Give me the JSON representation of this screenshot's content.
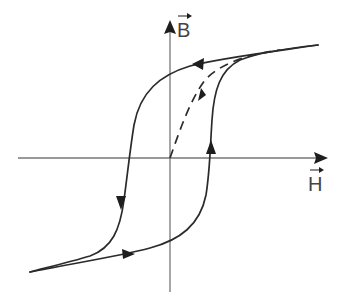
{
  "diagram": {
    "axes": {
      "y_label": "B",
      "x_label": "H",
      "y_label_vector": true,
      "x_label_vector": true
    },
    "curves": [
      {
        "name": "upper-branch",
        "style": "solid",
        "direction": "decreasing H",
        "from": "positive saturation",
        "to": "negative saturation"
      },
      {
        "name": "lower-branch",
        "style": "solid",
        "direction": "increasing H",
        "from": "negative saturation",
        "to": "positive saturation"
      },
      {
        "name": "initial-magnetization-curve",
        "style": "dashed",
        "direction": "increasing H",
        "from": "origin",
        "to": "positive saturation"
      }
    ],
    "colors": {
      "axis": "#777777",
      "curve": "#2b2b2b",
      "label": "#444444",
      "background": "#ffffff"
    }
  }
}
